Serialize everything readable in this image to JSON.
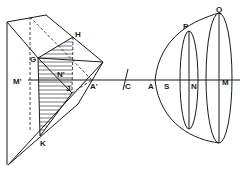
{
  "diagram": {
    "labels": {
      "G": "G",
      "H": "H",
      "N_prime": "N'",
      "M_prime": "M'",
      "J": "J",
      "A_prime": "A'",
      "K": "K",
      "C": "C",
      "A": "A",
      "S": "S",
      "N": "N",
      "M": "M",
      "P": "P",
      "Q": "Q"
    },
    "colors": {
      "ink": "#1a1a1a",
      "background": "#ffffff"
    }
  }
}
